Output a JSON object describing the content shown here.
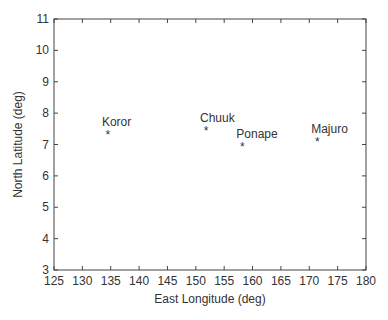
{
  "chart_data": {
    "type": "scatter",
    "title": "",
    "xlabel": "East Longitude (deg)",
    "ylabel": "North Latitude (deg)",
    "xlim": [
      125,
      180
    ],
    "ylim": [
      3,
      11
    ],
    "xticks": [
      125,
      130,
      135,
      140,
      145,
      150,
      155,
      160,
      165,
      170,
      175,
      180
    ],
    "yticks": [
      3,
      4,
      5,
      6,
      7,
      8,
      9,
      10,
      11
    ],
    "grid": false,
    "marker": "*",
    "points": [
      {
        "label": "Koror",
        "x": 134.5,
        "y": 7.35
      },
      {
        "label": "Chuuk",
        "x": 151.8,
        "y": 7.45
      },
      {
        "label": "Ponape",
        "x": 158.2,
        "y": 6.95
      },
      {
        "label": "Majuro",
        "x": 171.4,
        "y": 7.1
      }
    ]
  }
}
